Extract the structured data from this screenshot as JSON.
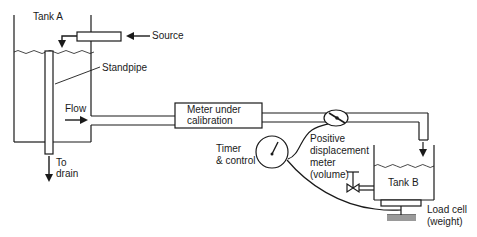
{
  "diagram": {
    "type": "flowmeter-calibration-schematic",
    "components": {
      "tank_a": {
        "label": "Tank A"
      },
      "source": {
        "label": "Source"
      },
      "standpipe": {
        "label": "Standpipe"
      },
      "drain": {
        "label_line1": "To",
        "label_line2": "drain"
      },
      "flow": {
        "label": "Flow"
      },
      "meter_under_calibration": {
        "label_line1": "Meter under",
        "label_line2": "calibration"
      },
      "timer": {
        "label_line1": "Timer",
        "label_line2": "& control"
      },
      "pd_meter": {
        "label_line1": "Positive",
        "label_line2": "displacement",
        "label_line3": "meter",
        "label_line4": "(volume)"
      },
      "tank_b": {
        "label": "Tank B"
      },
      "load_cell": {
        "label_line1": "Load cell",
        "label_line2": "(weight)"
      }
    },
    "colors": {
      "line": "#1a1a1a",
      "load_cell_base": "#9a9a9a",
      "background": "#ffffff"
    }
  }
}
